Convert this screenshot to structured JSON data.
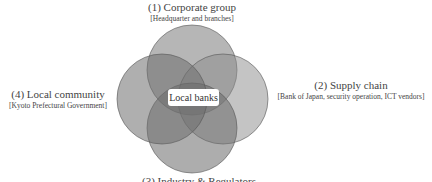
{
  "diagram": {
    "type": "venn",
    "center_label": "Local banks",
    "groups": [
      {
        "title": "(1)  Corporate group",
        "subtitle": "[Headquarter and branches]"
      },
      {
        "title": "(2) Supply chain",
        "subtitle": "[Bank of Japan, security operation, ICT vendors]"
      },
      {
        "title": "(3) Industry & Regulators",
        "subtitle": ""
      },
      {
        "title": "(4) Local community",
        "subtitle": "[Kyoto Prefectural Government]"
      }
    ],
    "colors": {
      "circle_fill": "#6e6e6e",
      "circle_stroke": "#555555",
      "background": "#ffffff"
    }
  }
}
